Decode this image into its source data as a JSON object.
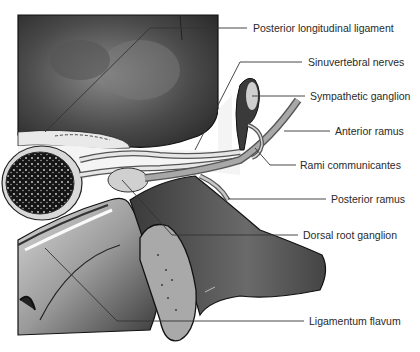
{
  "figure": {
    "colors": {
      "background": "#ffffff",
      "bone_dark": "#2b2b2b",
      "bone_mid": "#6e6e6e",
      "bone_light": "#b9b9b9",
      "leader_line": "#333333",
      "label_text": "#2a2a2a"
    },
    "labels": [
      {
        "id": "posterior-longitudinal-ligament",
        "text": "Posterior longitudinal ligament",
        "x": 253,
        "y": 24
      },
      {
        "id": "sinuvertebral-nerves",
        "text": "Sinuvertebral nerves",
        "x": 308,
        "y": 56
      },
      {
        "id": "sympathetic-ganglion",
        "text": "Sympathetic ganglion",
        "x": 310,
        "y": 90
      },
      {
        "id": "anterior-ramus",
        "text": "Anterior ramus",
        "x": 335,
        "y": 125
      },
      {
        "id": "rami-communicantes",
        "text": "Rami communicantes",
        "x": 300,
        "y": 159
      },
      {
        "id": "posterior-ramus",
        "text": "Posterior ramus",
        "x": 331,
        "y": 193
      },
      {
        "id": "dorsal-root-ganglion",
        "text": "Dorsal root ganglion",
        "x": 303,
        "y": 229
      },
      {
        "id": "ligamentum-flavum",
        "text": "Ligamentum flavum",
        "x": 309,
        "y": 315
      }
    ]
  }
}
